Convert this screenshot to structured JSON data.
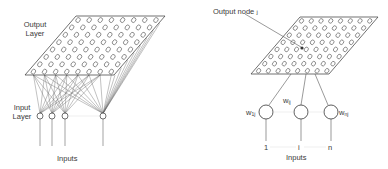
{
  "left_panel": {
    "output_layer_label_line1": "Output",
    "output_layer_label_line2": "Layer",
    "input_layer_label_line1": "Input",
    "input_layer_label_line2": "Layer",
    "inputs_label": "Inputs",
    "grid": {
      "rows": 8,
      "cols": 8
    },
    "input_nodes": 4
  },
  "right_panel": {
    "output_node_label": "Output node ",
    "output_node_symbol": "j",
    "weights": [
      {
        "w": "w",
        "sub": "1j"
      },
      {
        "w": "w",
        "sub": "ij"
      },
      {
        "w": "w",
        "sub": "nj"
      }
    ],
    "input_indices": [
      "1",
      "i",
      "n"
    ],
    "inputs_label": "Inputs",
    "grid": {
      "rows": 8,
      "cols": 8
    }
  },
  "colors": {
    "line": "#444444",
    "faint": "#bbbbbb"
  }
}
